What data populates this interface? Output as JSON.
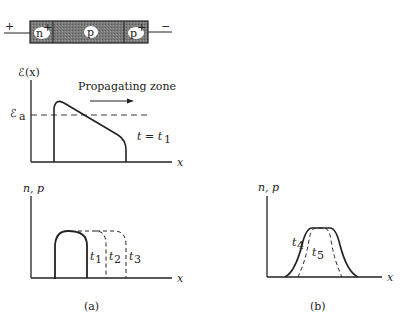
{
  "device": {
    "plus_terminal": "+",
    "minus_terminal": "−",
    "regions": [
      {
        "label": "n",
        "superscript": "+"
      },
      {
        "label": "p",
        "superscript": ""
      },
      {
        "label": "p",
        "superscript": "+"
      }
    ],
    "fill_color": "#6b6b6b"
  },
  "field_plot": {
    "y_label": "ℰ(x)",
    "threshold_label": "ℰ",
    "threshold_sub": "a",
    "zone_label": "Propagating zone",
    "time_label": "t = t",
    "time_sub": "1",
    "x_label": "x"
  },
  "carrier_plot_a": {
    "y_label": "n, p",
    "x_label": "x",
    "curves": [
      {
        "label": "t",
        "sub": "1",
        "style": "solid"
      },
      {
        "label": "t",
        "sub": "2",
        "style": "dashed"
      },
      {
        "label": "t",
        "sub": "3",
        "style": "dashed"
      }
    ],
    "panel_label": "(a)"
  },
  "carrier_plot_b": {
    "y_label": "n, p",
    "x_label": "x",
    "curves": [
      {
        "label": "t",
        "sub": "4",
        "style": "solid"
      },
      {
        "label": "t",
        "sub": "5",
        "style": "dashed"
      }
    ],
    "panel_label": "(b)"
  }
}
